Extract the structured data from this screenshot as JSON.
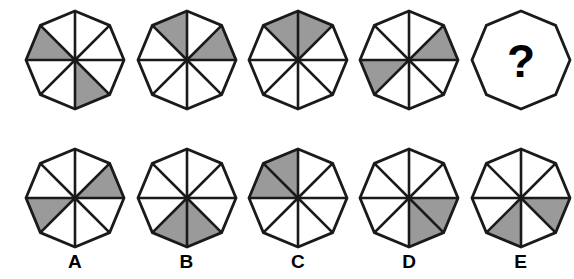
{
  "puzzle": {
    "type": "matrix-reasoning-octagon-sequence",
    "sector_count": 8,
    "sector_scheme": "index 0 = sector from 12 o'clock to 1:30, increasing clockwise",
    "colors": {
      "shaded": "#9a9a9a",
      "unshaded": "#ffffff",
      "outline": "#1a1a1a",
      "background": "#ffffff",
      "label": "#000000"
    },
    "question_mark": "?"
  },
  "question_row": {
    "name": "sequence-row",
    "items": [
      {
        "id": "q1",
        "name": "sequence-figure-1",
        "shaded_sectors": [
          3,
          6
        ],
        "is_question": false
      },
      {
        "id": "q2",
        "name": "sequence-figure-2",
        "shaded_sectors": [
          1,
          7
        ],
        "is_question": false
      },
      {
        "id": "q3",
        "name": "sequence-figure-3",
        "shaded_sectors": [
          0,
          7
        ],
        "is_question": false
      },
      {
        "id": "q4",
        "name": "sequence-figure-4",
        "shaded_sectors": [
          1,
          5
        ],
        "is_question": false
      },
      {
        "id": "q5",
        "name": "sequence-figure-missing",
        "shaded_sectors": [],
        "is_question": true
      }
    ]
  },
  "options_row": {
    "name": "answer-options-row",
    "items": [
      {
        "id": "A",
        "name": "answer-option-a",
        "label": "A",
        "shaded_sectors": [
          1,
          5
        ]
      },
      {
        "id": "B",
        "name": "answer-option-b",
        "label": "B",
        "shaded_sectors": [
          3,
          4
        ]
      },
      {
        "id": "C",
        "name": "answer-option-c",
        "label": "C",
        "shaded_sectors": [
          6,
          7
        ]
      },
      {
        "id": "D",
        "name": "answer-option-d",
        "label": "D",
        "shaded_sectors": [
          2,
          3
        ]
      },
      {
        "id": "E",
        "name": "answer-option-e",
        "label": "E",
        "shaded_sectors": [
          2,
          4
        ]
      }
    ]
  }
}
